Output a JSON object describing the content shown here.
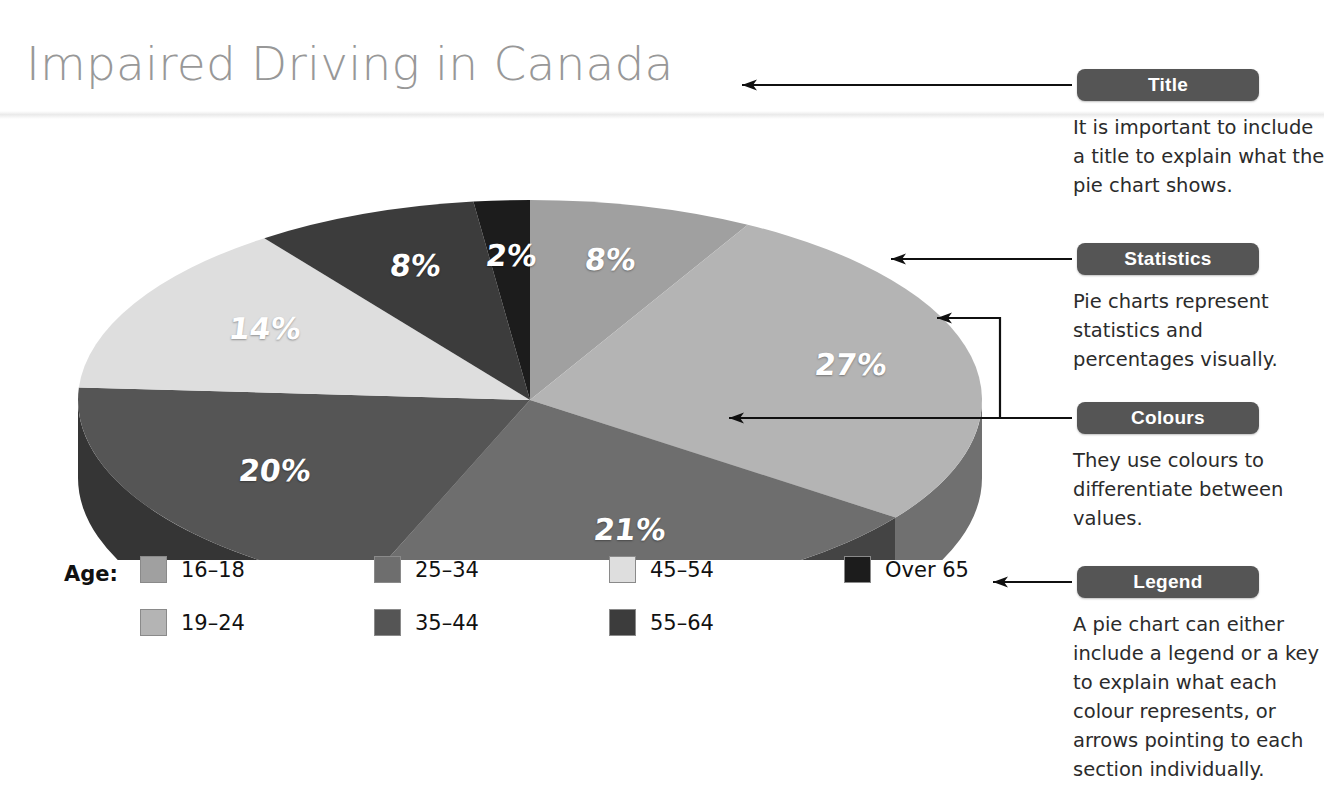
{
  "title": "Impaired Driving in Canada",
  "legend_prefix": "Age:",
  "callouts": [
    {
      "label": "Title",
      "note": "It is important to include a title to explain what the pie chart shows."
    },
    {
      "label": "Statistics",
      "note": "Pie charts represent statistics and percentages visually."
    },
    {
      "label": "Colours",
      "note": "They use colours to differentiate between values."
    },
    {
      "label": "Legend",
      "note": "A pie chart can either include a legend or a key to explain what each colour represents, or arrows pointing to each section individually."
    }
  ],
  "chart_data": {
    "type": "pie",
    "title": "Impaired Driving in Canada",
    "legend_title": "Age:",
    "legend_position": "bottom",
    "grid": false,
    "three_d": true,
    "categories": [
      "16–18",
      "19–24",
      "25–34",
      "35–44",
      "45–54",
      "55–64",
      "Over 65"
    ],
    "values": [
      8,
      27,
      21,
      20,
      14,
      8,
      2
    ],
    "value_labels": [
      "8%",
      "27%",
      "21%",
      "20%",
      "14%",
      "8%",
      "2%"
    ],
    "colors": [
      "#a0a0a0",
      "#b4b4b4",
      "#6e6e6e",
      "#555555",
      "#dedede",
      "#3c3c3c",
      "#1c1c1c"
    ],
    "slices": [
      {
        "category": "16–18",
        "value": 8,
        "label": "8%",
        "color": "#a0a0a0"
      },
      {
        "category": "19–24",
        "value": 27,
        "label": "27%",
        "color": "#b4b4b4"
      },
      {
        "category": "25–34",
        "value": 21,
        "label": "21%",
        "color": "#6e6e6e"
      },
      {
        "category": "35–44",
        "value": 20,
        "label": "20%",
        "color": "#555555"
      },
      {
        "category": "45–54",
        "value": 14,
        "label": "14%",
        "color": "#dedede"
      },
      {
        "category": "55–64",
        "value": 8,
        "label": "8%",
        "color": "#3c3c3c"
      },
      {
        "category": "Over 65",
        "value": 2,
        "label": "2%",
        "color": "#1c1c1c"
      }
    ],
    "xlabel": "",
    "ylabel": ""
  },
  "colors": {
    "title_text": "#989898",
    "chip_bg": "#555555",
    "chip_text": "#ffffff",
    "note_text": "#2b2b2b",
    "arrow": "#101010"
  }
}
